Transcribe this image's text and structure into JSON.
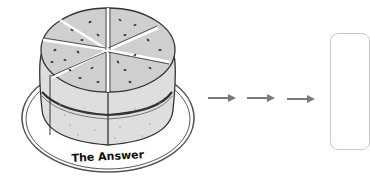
{
  "diagram": {
    "cake": {
      "label": "The Answer",
      "slices": 7,
      "colors": {
        "top": "#cfcfcf",
        "side": "#dedede",
        "outline": "#333333",
        "seeds": "#3a3a3a",
        "plate": "#555555"
      }
    },
    "arrows": {
      "count": 3,
      "color": "#7a7a7a"
    },
    "target_box": {
      "content": "",
      "border_color": "#c8c8c8"
    }
  }
}
